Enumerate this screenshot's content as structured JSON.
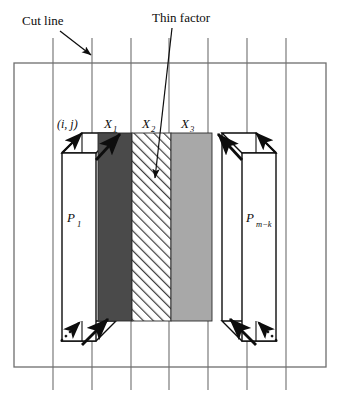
{
  "figure": {
    "type": "technical-diagram",
    "background_color": "#ffffff",
    "line_color": "#6e6e6e",
    "ink_color": "#0d0d0d"
  },
  "callouts": {
    "cut_line": {
      "label": "Cut line",
      "target_description": "second vertical grid line"
    },
    "thin_factor": {
      "label": "Thin factor",
      "target_description": "hatched middle column X2"
    }
  },
  "grid": {
    "outer_box": {
      "x": 14,
      "y": 63,
      "width": 312,
      "height": 304
    },
    "vertical_lines_x": [
      53,
      92,
      131,
      169,
      208,
      247,
      286
    ],
    "line_top": 38,
    "line_bottom": 390
  },
  "prisms": [
    {
      "name": "left-prism",
      "label": "P",
      "subscript": "1",
      "fill": "#ffffff"
    },
    {
      "name": "right-prism",
      "label": "P",
      "subscript": "m−k",
      "fill": "#ffffff"
    }
  ],
  "columns": [
    {
      "name": "column-x1",
      "label": "X",
      "subscript": "1",
      "fill": "#4a4a4a",
      "pattern": "solid",
      "x": 98,
      "width": 34
    },
    {
      "name": "column-x2",
      "label": "X",
      "subscript": "2",
      "fill": "#ffffff",
      "pattern": "diagonal-hatch",
      "x": 132,
      "width": 39
    },
    {
      "name": "column-x3",
      "label": "X",
      "subscript": "3",
      "fill": "#a8a8a8",
      "pattern": "solid",
      "x": 171,
      "width": 41
    }
  ],
  "cell_label": {
    "name": "cell-index-label",
    "text": "(i, j)"
  },
  "arrows": {
    "solid_count": 6,
    "dotted_count": 2,
    "style_solid": "filled triangular head",
    "style_dotted": "dotted shaft with filled head"
  }
}
